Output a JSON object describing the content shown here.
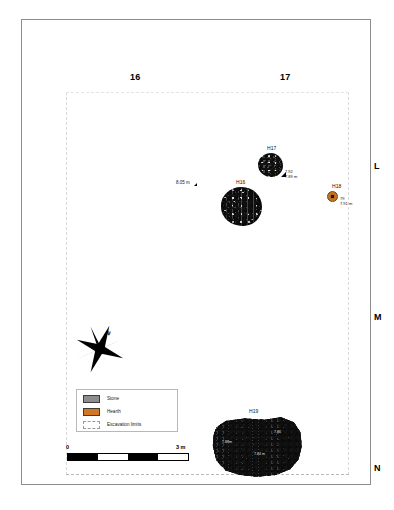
{
  "map": {
    "type": "archaeological-site-plan",
    "grid": {
      "columns": [
        {
          "label": "16"
        },
        {
          "label": "17"
        }
      ],
      "rows": [
        {
          "label": "L"
        },
        {
          "label": "M"
        },
        {
          "label": "N"
        }
      ]
    },
    "features": [
      {
        "id": "H17",
        "kind": "stone",
        "label": "H17",
        "elevation_lines": [
          "7.92",
          "7.89 m"
        ]
      },
      {
        "id": "H16",
        "kind": "stone",
        "label": "H16",
        "elevation_lines": []
      },
      {
        "id": "H18",
        "kind": "hearth",
        "label": "H18",
        "elevation_lines": [
          "79",
          "7.91 m"
        ]
      },
      {
        "id": "H19",
        "kind": "stone",
        "label": "H19",
        "elevation_lines": [
          "7.88m",
          "7.85",
          "7.84 m",
          "7.86"
        ]
      }
    ],
    "spot_heights": [
      {
        "value": "8.05 m"
      }
    ],
    "compass": {
      "north_label": "N"
    },
    "legend": {
      "items": [
        {
          "label": "Stone",
          "color": "#8d8d8d"
        },
        {
          "label": "Hearth",
          "color": "#d2761f"
        },
        {
          "label": "Excavation limits",
          "color": "#ffffff"
        }
      ]
    },
    "scale_bar": {
      "min_label": "0",
      "max_label": "3 m",
      "segments": 4
    }
  }
}
